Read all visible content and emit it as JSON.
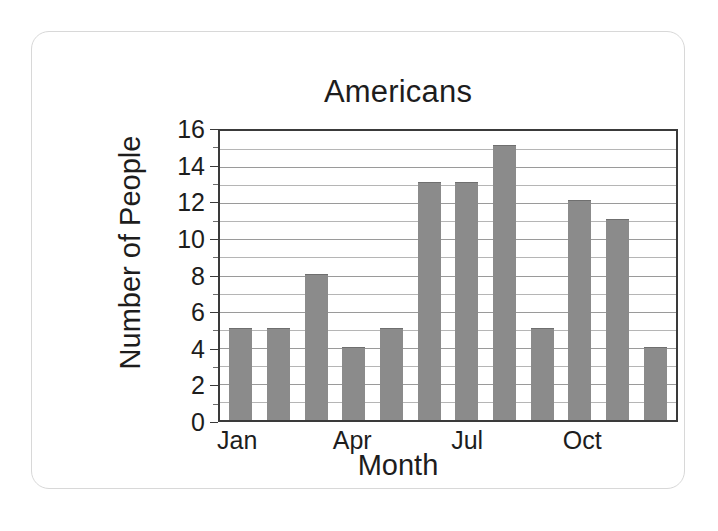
{
  "scan": {
    "cut_off_top_text": ". . . . ."
  },
  "chart_data": {
    "type": "bar",
    "title": "Americans",
    "xlabel": "Month",
    "ylabel": "Number of People",
    "categories": [
      "Jan",
      "Feb",
      "Mar",
      "Apr",
      "May",
      "Jun",
      "Jul",
      "Aug",
      "Sep",
      "Oct",
      "Nov",
      "Dec"
    ],
    "values": [
      5,
      5,
      8,
      4,
      5,
      13,
      13,
      15,
      5,
      12,
      11,
      4
    ],
    "visible_xticks": [
      {
        "label": "Jan",
        "category_index": 0
      },
      {
        "label": "Apr",
        "category_index": 3
      },
      {
        "label": "Jul",
        "category_index": 6
      },
      {
        "label": "Oct",
        "category_index": 9
      }
    ],
    "ylim": [
      0,
      16
    ],
    "ytick_labels": [
      "0",
      "2",
      "4",
      "6",
      "8",
      "10",
      "12",
      "14",
      "16"
    ],
    "ytick_values": [
      0,
      2,
      4,
      6,
      8,
      10,
      12,
      14,
      16
    ],
    "yminor_values": [
      1,
      3,
      5,
      7,
      9,
      11,
      13,
      15
    ],
    "grid": true,
    "legend": "none",
    "bar_color": "#8b8b8b",
    "axis_color": "#3a3a3a",
    "grid_color": "#9a9a9a",
    "text_color": "#1d1d1d"
  }
}
